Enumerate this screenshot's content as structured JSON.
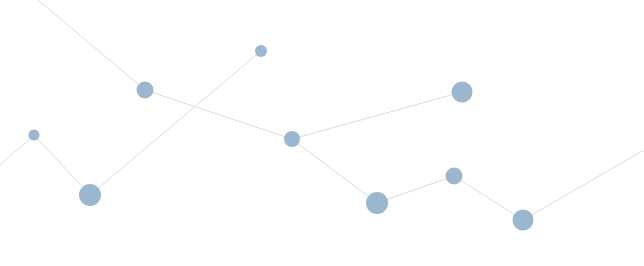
{
  "diagram": {
    "type": "network-graph",
    "background": "#ffffff",
    "node_color": "#9bb6cf",
    "edge_color": "#d9dcdf",
    "width": 644,
    "height": 266,
    "nodes": [
      {
        "id": "A",
        "x": 34,
        "y": 135,
        "r": 5.5
      },
      {
        "id": "B",
        "x": 90,
        "y": 195,
        "r": 11
      },
      {
        "id": "C",
        "x": 145,
        "y": 90,
        "r": 8.5
      },
      {
        "id": "D",
        "x": 261,
        "y": 51,
        "r": 6
      },
      {
        "id": "E",
        "x": 292,
        "y": 139,
        "r": 8
      },
      {
        "id": "F",
        "x": 377,
        "y": 203,
        "r": 11
      },
      {
        "id": "G",
        "x": 462,
        "y": 92,
        "r": 10.5
      },
      {
        "id": "H",
        "x": 454,
        "y": 176,
        "r": 8.5
      },
      {
        "id": "I",
        "x": 523,
        "y": 220,
        "r": 10.5
      }
    ],
    "edges": [
      {
        "x1": 0,
        "y1": 165,
        "x2": 34,
        "y2": 135
      },
      {
        "x1": 34,
        "y1": 135,
        "x2": 90,
        "y2": 195
      },
      {
        "x1": 90,
        "y1": 195,
        "x2": 261,
        "y2": 51
      },
      {
        "x1": 38,
        "y1": 0,
        "x2": 145,
        "y2": 90
      },
      {
        "x1": 145,
        "y1": 90,
        "x2": 292,
        "y2": 139
      },
      {
        "x1": 292,
        "y1": 139,
        "x2": 462,
        "y2": 92
      },
      {
        "x1": 292,
        "y1": 139,
        "x2": 377,
        "y2": 203
      },
      {
        "x1": 377,
        "y1": 203,
        "x2": 454,
        "y2": 176
      },
      {
        "x1": 454,
        "y1": 176,
        "x2": 523,
        "y2": 220
      },
      {
        "x1": 523,
        "y1": 220,
        "x2": 644,
        "y2": 150
      }
    ]
  }
}
